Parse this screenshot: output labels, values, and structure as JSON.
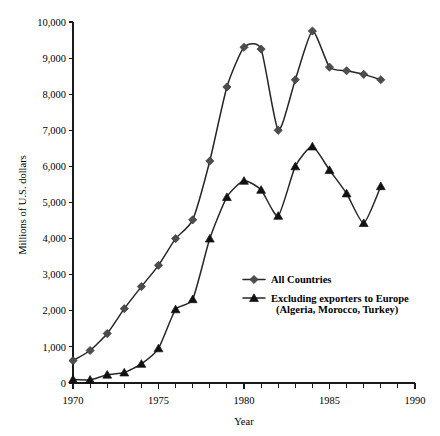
{
  "chart_data": {
    "type": "line",
    "title": "",
    "xlabel": "Year",
    "ylabel": "Millions of U.S. dollars",
    "xlim": [
      1970,
      1990
    ],
    "ylim": [
      0,
      10000
    ],
    "xticks": [
      1970,
      1975,
      1980,
      1985,
      1990
    ],
    "xtick_labels": [
      "1970",
      "1975",
      "1980",
      "1985",
      "1990"
    ],
    "xtick_minor_step": 1,
    "yticks": [
      0,
      1000,
      2000,
      3000,
      4000,
      5000,
      6000,
      7000,
      8000,
      9000,
      10000
    ],
    "ytick_labels": [
      "0",
      "1,000",
      "2,000",
      "3,000",
      "4,000",
      "5,000",
      "6,000",
      "7,000",
      "8,000",
      "9,000",
      "10,000"
    ],
    "grid": false,
    "legend_position": "center-right",
    "x": [
      1970,
      1971,
      1972,
      1973,
      1974,
      1975,
      1976,
      1977,
      1978,
      1979,
      1980,
      1981,
      1982,
      1983,
      1984,
      1985,
      1986,
      1987,
      1988
    ],
    "series": [
      {
        "name": "All Countries",
        "marker": "diamond",
        "color": "#4d4d4d",
        "values": [
          620,
          900,
          1370,
          2060,
          2670,
          3260,
          4000,
          4520,
          6150,
          8200,
          9300,
          9250,
          7000,
          8400,
          9750,
          8750,
          8650,
          8550,
          8400
        ]
      },
      {
        "name": "Excluding exporters to Europe (Algeria, Morocco, Turkey)",
        "marker": "triangle",
        "color": "#111111",
        "values": [
          100,
          90,
          230,
          290,
          530,
          960,
          2040,
          2320,
          4000,
          5150,
          5600,
          5350,
          4630,
          6000,
          6550,
          5900,
          5250,
          4430,
          5450
        ]
      }
    ],
    "legend": [
      {
        "label": "All Countries",
        "marker": "diamond",
        "sublabel": ""
      },
      {
        "label": "Excluding exporters to Europe",
        "marker": "triangle",
        "sublabel": "(Algeria, Morocco, Turkey)"
      }
    ]
  }
}
